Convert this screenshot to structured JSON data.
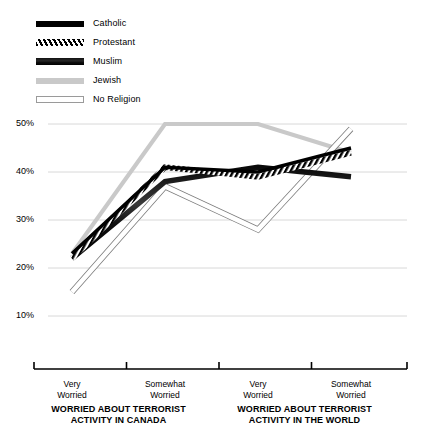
{
  "chart_data": {
    "type": "line",
    "title": "",
    "xlabel": "",
    "ylabel": "",
    "ylim": [
      5,
      52
    ],
    "ytick_values": [
      50,
      40,
      30,
      20,
      10
    ],
    "ytick_labels": [
      "50%",
      "40%",
      "30%",
      "20%",
      "10%"
    ],
    "grid": true,
    "legend_position": "top-left",
    "categories": [
      "Very Worried",
      "Somewhat Worried",
      "Very Worried",
      "Somewhat Worried"
    ],
    "category_lines": [
      {
        "l1": "Very",
        "l2": "Worried"
      },
      {
        "l1": "Somewhat",
        "l2": "Worried"
      },
      {
        "l1": "Very",
        "l2": "Worried"
      },
      {
        "l1": "Somewhat",
        "l2": "Worried"
      }
    ],
    "groups": [
      {
        "title_line1": "WORRIED ABOUT TERRORIST",
        "title_line2": "ACTIVITY IN CANADA",
        "categories": [
          0,
          1
        ]
      },
      {
        "title_line1": "WORRIED ABOUT TERRORIST",
        "title_line2": "ACTIVITY IN THE WORLD",
        "categories": [
          2,
          3
        ]
      }
    ],
    "series": [
      {
        "name": "Catholic",
        "style": "solid-black",
        "color": "#000000",
        "values": [
          23,
          41,
          40,
          45
        ]
      },
      {
        "name": "Protestant",
        "style": "hatched",
        "color": "#000000",
        "values": [
          22,
          41,
          39,
          44
        ]
      },
      {
        "name": "Muslim",
        "style": "thick-shaded",
        "color": "#1a1a1a",
        "values": [
          22,
          38,
          41,
          39
        ]
      },
      {
        "name": "Jewish",
        "style": "light-gray",
        "color": "#c9c9c9",
        "values": [
          23,
          50,
          50,
          44
        ]
      },
      {
        "name": "No Religion",
        "style": "white-outline",
        "color": "#ffffff",
        "values": [
          15,
          37,
          28,
          49
        ]
      }
    ]
  },
  "legend": {
    "items": [
      {
        "label": "Catholic",
        "swatch": "swatch-catholic"
      },
      {
        "label": "Protestant",
        "swatch": "swatch-protestant"
      },
      {
        "label": "Muslim",
        "swatch": "swatch-muslim"
      },
      {
        "label": "Jewish",
        "swatch": "swatch-jewish"
      },
      {
        "label": "No Religion",
        "swatch": "swatch-no-religion"
      }
    ]
  }
}
